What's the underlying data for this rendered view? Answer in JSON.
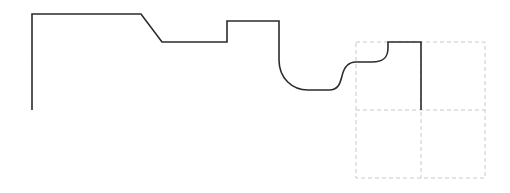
{
  "diagram": {
    "type": "line-profile",
    "stroke_color": "#2b2b2b",
    "grid_color": "#c8c8c8",
    "grid": {
      "rows": 2,
      "cols": 2,
      "style": "dashed"
    },
    "profile_segments": [
      "vertical-left-edge",
      "top-flat",
      "chamfer",
      "lower-flat",
      "step-up",
      "raised-flat",
      "fillet-drop",
      "bottom-flat",
      "s-curve-rise",
      "mid-flat",
      "fillet-rise",
      "top-step",
      "vertical-right-edge"
    ]
  }
}
